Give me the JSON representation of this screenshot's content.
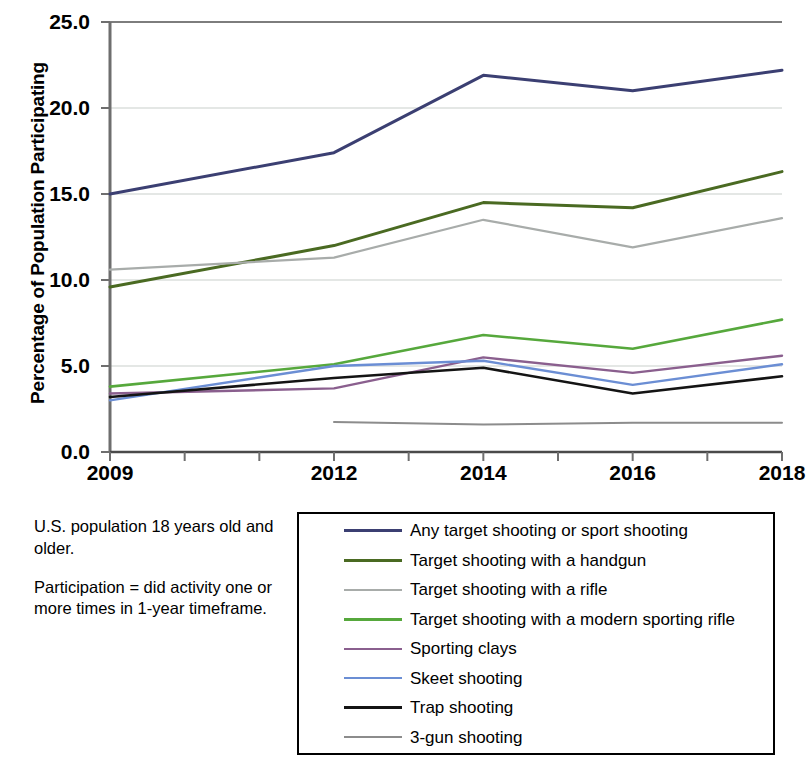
{
  "chart_data": {
    "type": "line",
    "title": "",
    "xlabel": "",
    "ylabel": "Percentage of Population Participating",
    "x": [
      2009,
      2012,
      2014,
      2016,
      2018
    ],
    "xlim": [
      2009,
      2018
    ],
    "ylim": [
      0.0,
      25.0
    ],
    "x_tick_labels": [
      "2009",
      "2012",
      "2014",
      "2016",
      "2018"
    ],
    "x_tick_values": [
      2009,
      2012,
      2014,
      2016,
      2018
    ],
    "x_minor_tick_values": [
      2010,
      2011,
      2013,
      2015,
      2017
    ],
    "y_tick_labels": [
      "25.0",
      "20.0",
      "15.0",
      "10.0",
      "5.0",
      "0.0"
    ],
    "y_tick_values": [
      25.0,
      20.0,
      15.0,
      10.0,
      5.0,
      0.0
    ],
    "grid": "horizontal",
    "legend_position": "bottom-right",
    "series": [
      {
        "name": "Any target shooting or sport shooting",
        "color": "#3b3f72",
        "width": 3.0,
        "x": [
          2009,
          2012,
          2014,
          2016,
          2018
        ],
        "values": [
          15.0,
          17.4,
          21.9,
          21.0,
          22.2
        ]
      },
      {
        "name": "Target shooting with a handgun",
        "color": "#4a6a22",
        "width": 3.0,
        "x": [
          2009,
          2012,
          2014,
          2016,
          2018
        ],
        "values": [
          9.6,
          12.0,
          14.5,
          14.2,
          16.3
        ]
      },
      {
        "name": "Target shooting with a rifle",
        "color": "#a8acaa",
        "width": 2.2,
        "x": [
          2009,
          2012,
          2014,
          2016,
          2018
        ],
        "values": [
          10.6,
          11.3,
          13.5,
          11.9,
          13.6
        ]
      },
      {
        "name": "Target shooting with a modern sporting rifle",
        "color": "#56a83c",
        "width": 2.6,
        "x": [
          2009,
          2012,
          2014,
          2016,
          2018
        ],
        "values": [
          3.8,
          5.1,
          6.8,
          6.0,
          7.7
        ]
      },
      {
        "name": "Sporting clays",
        "color": "#8a5f8e",
        "width": 2.4,
        "x": [
          2009,
          2012,
          2014,
          2016,
          2018
        ],
        "values": [
          3.4,
          3.7,
          5.5,
          4.6,
          5.6
        ]
      },
      {
        "name": "Skeet shooting",
        "color": "#6b8ed4",
        "width": 2.4,
        "x": [
          2009,
          2012,
          2014,
          2016,
          2018
        ],
        "values": [
          3.0,
          5.0,
          5.3,
          3.9,
          5.1
        ]
      },
      {
        "name": "Trap shooting",
        "color": "#141414",
        "width": 2.6,
        "x": [
          2009,
          2012,
          2014,
          2016,
          2018
        ],
        "values": [
          3.2,
          4.3,
          4.9,
          3.4,
          4.4
        ]
      },
      {
        "name": "3-gun shooting",
        "color": "#8c8c8c",
        "width": 2.0,
        "x": [
          2012,
          2014,
          2016,
          2018
        ],
        "values": [
          1.75,
          1.6,
          1.7,
          1.7
        ]
      }
    ]
  },
  "notes": {
    "paragraph_1": "U.S. population 18 years old and older.",
    "paragraph_2": "Participation = did activity one or more times in 1-year timeframe."
  }
}
